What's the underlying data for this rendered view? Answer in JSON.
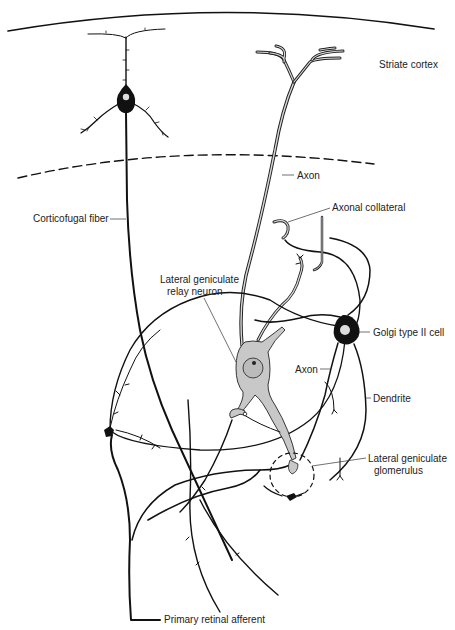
{
  "diagram": {
    "type": "neuroanatomy-schematic",
    "regions": {
      "cortex_boundary": "solid arc (pial surface)",
      "cortex_lgn_boundary": "dashed arc"
    },
    "labels": {
      "striate_cortex": "Striate cortex",
      "axon_upper": "Axon",
      "axonal_collateral": "Axonal collateral",
      "corticofugal_fiber": "Corticofugal fiber",
      "relay_neuron_line1": "Lateral geniculate",
      "relay_neuron_line2": "relay neuron",
      "golgi_cell": "Golgi type II cell",
      "axon_lower": "Axon",
      "dendrite": "Dendrite",
      "glomerulus_line1": "Lateral geniculate",
      "glomerulus_line2": "glomerulus",
      "retinal_afferent": "Primary retinal afferent"
    },
    "elements": [
      {
        "name": "pyramidal-cell",
        "fill": "#111111"
      },
      {
        "name": "relay-neuron",
        "fill": "#c8c8c8"
      },
      {
        "name": "golgi-type-ii-cell",
        "fill": "#111111"
      },
      {
        "name": "glomerulus-circle",
        "style": "dashed"
      }
    ],
    "colors": {
      "ink": "#111111",
      "relay_fill": "#c8c8c8",
      "background": "#ffffff"
    }
  }
}
